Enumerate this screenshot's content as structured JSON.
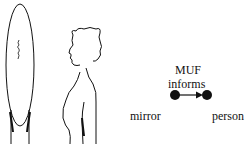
{
  "diagram": {
    "relation_label": "MUF",
    "edge_label": "informs",
    "source_node": "mirror",
    "target_node": "person",
    "edge_direction": "mirror -> person",
    "colors": {
      "ink": "#111111",
      "background": "#ffffff"
    }
  }
}
